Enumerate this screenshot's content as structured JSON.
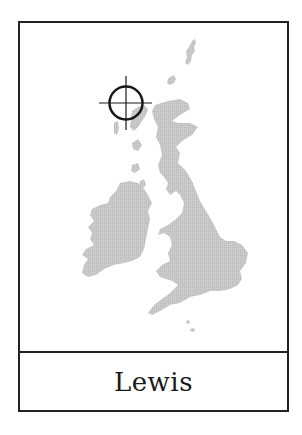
{
  "card": {
    "place_name": "Lewis"
  },
  "map": {
    "region": "British Isles",
    "land_color": "#c6c6c6",
    "marker_color": "#1a1a1a",
    "marker": {
      "type": "crosshair-circle",
      "target": "Lewis"
    },
    "landmasses": [
      "Great Britain",
      "Ireland",
      "Shetland",
      "Orkney",
      "Outer Hebrides",
      "Inner Hebrides",
      "Isle of Man",
      "Channel Islands"
    ]
  }
}
